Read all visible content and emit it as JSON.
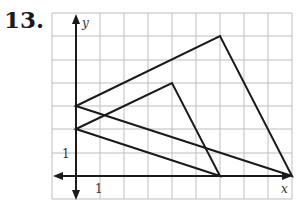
{
  "problem_number": "13.",
  "axes": {
    "x_label": "x",
    "y_label": "y",
    "x_tick_label": "1",
    "y_tick_label": "1"
  },
  "grid": {
    "x_min": -1,
    "x_max": 9,
    "y_min": -1,
    "y_max": 7
  },
  "triangles": [
    {
      "name": "large",
      "vertices": [
        [
          0,
          3
        ],
        [
          6,
          6
        ],
        [
          9,
          0
        ]
      ]
    },
    {
      "name": "small",
      "vertices": [
        [
          0,
          2
        ],
        [
          4,
          4
        ],
        [
          6,
          0
        ]
      ]
    }
  ],
  "colors": {
    "grid": "#bdbdbd",
    "lines": "#1a1a1a"
  }
}
